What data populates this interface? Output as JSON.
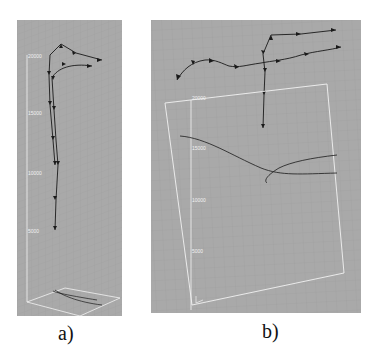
{
  "figure": {
    "panels": [
      {
        "id": "a",
        "caption": "a)",
        "view": "side view of 3D trajectories above a ground plane",
        "axis_ticks": [
          "20000",
          "15000",
          "10000",
          "5000"
        ]
      },
      {
        "id": "b",
        "caption": "b)",
        "view": "top/oblique view of 3D trajectories with ground projection",
        "axis_ticks": [
          "20000",
          "15000",
          "10000",
          "5000"
        ]
      }
    ],
    "colors": {
      "background": "#a9a9a9",
      "grid": "#9a9a9a",
      "axis": "#f2f2f2",
      "track": "#1a1a1a"
    }
  }
}
